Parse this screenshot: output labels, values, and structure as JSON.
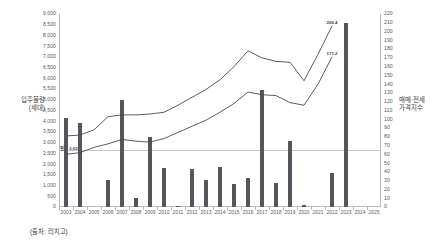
{
  "chart_title": "",
  "axis_titles": {
    "left": "입주물량\n(세대)",
    "left_line1": "입주물량",
    "left_line2": "(세대)",
    "right_line1": "매매·전세",
    "right_line2": "가격지수"
  },
  "source_note": "(출처: 리치고)",
  "average_label": "평균 2,651",
  "average_value": 2651,
  "chart_data": {
    "type": "bar",
    "title": "",
    "xlabel": "",
    "ylabel": "입주물량 (세대)",
    "y2label": "매매·전세 가격지수",
    "grid": false,
    "legend": "none",
    "categories": [
      "2003",
      "2004",
      "2005",
      "2006",
      "2007",
      "2008",
      "2009",
      "2010",
      "2011",
      "2012",
      "2013",
      "2014",
      "2015",
      "2016",
      "2017",
      "2018",
      "2019",
      "2020",
      "2021",
      "2022",
      "2023",
      "2024",
      "2025"
    ],
    "ylim": [
      0,
      9000
    ],
    "y_ticks": [
      "0",
      "500",
      "1,000",
      "1,500",
      "2,000",
      "2,500",
      "3,000",
      "3,500",
      "4,000",
      "4,500",
      "5,000",
      "5,500",
      "6,000",
      "6,500",
      "7,000",
      "7,500",
      "8,000",
      "8,500",
      "9,000"
    ],
    "y2lim": [
      0,
      220
    ],
    "y2_ticks": [
      "0",
      "10",
      "20",
      "30",
      "40",
      "50",
      "60",
      "70",
      "80",
      "90",
      "100",
      "110",
      "120",
      "130",
      "140",
      "150",
      "160",
      "170",
      "180",
      "190",
      "200",
      "210",
      "220"
    ],
    "series": [
      {
        "name": "입주물량(세대)",
        "type": "bar",
        "axis": "left",
        "color": "#55555c",
        "values": [
          4150,
          3900,
          0,
          1250,
          5000,
          400,
          3250,
          1830,
          20,
          1780,
          1240,
          1860,
          1070,
          1330,
          5460,
          1130,
          3100,
          80,
          0,
          1590,
          8600,
          0,
          0
        ]
      },
      {
        "name": "매매가격지수",
        "type": "line",
        "axis": "right",
        "color": "#4a4a50",
        "values": [
          81,
          82,
          88,
          103,
          105,
          105,
          106,
          108,
          116,
          125,
          134,
          145,
          160,
          178,
          170,
          166,
          165,
          144,
          174,
          206.4,
          null,
          null,
          null
        ],
        "end_label": "206.4"
      },
      {
        "name": "전세가격지수",
        "type": "line",
        "axis": "right",
        "color": "#4a4a50",
        "values": [
          60,
          62,
          68,
          72,
          77,
          75,
          74,
          78,
          85,
          92,
          99,
          108,
          118,
          131,
          128,
          127,
          119,
          116,
          140,
          171.2,
          null,
          null,
          null
        ],
        "end_label": "171.2"
      }
    ],
    "reference_line": {
      "axis": "left",
      "value": 2651,
      "label": "평균 2,651"
    }
  }
}
